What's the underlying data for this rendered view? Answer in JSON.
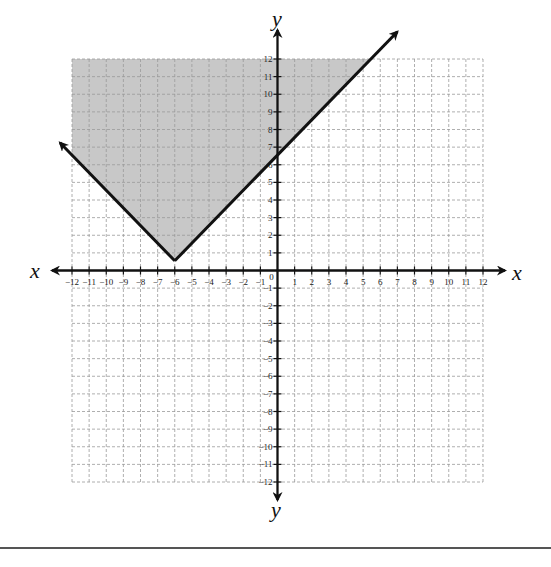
{
  "chart_data": {
    "type": "line",
    "title": "",
    "xlabel": "x",
    "ylabel": "y",
    "xlim": [
      -12,
      12
    ],
    "ylim": [
      -12,
      12
    ],
    "grid": true,
    "grid_style": "dashed",
    "x_ticks": [
      -12,
      -11,
      -10,
      -9,
      -8,
      -7,
      -6,
      -5,
      -4,
      -3,
      -2,
      -1,
      0,
      1,
      2,
      3,
      4,
      5,
      6,
      7,
      8,
      9,
      10,
      11,
      12
    ],
    "y_ticks": [
      -12,
      -11,
      -10,
      -9,
      -8,
      -7,
      -6,
      -5,
      -4,
      -3,
      -2,
      -1,
      1,
      2,
      3,
      4,
      5,
      6,
      7,
      8,
      9,
      10,
      11,
      12
    ],
    "x_tick_labels": [
      "−12",
      "−11",
      "−10",
      "−9",
      "−8",
      "−7",
      "−6",
      "−5",
      "−4",
      "−3",
      "−2",
      "−1",
      "0",
      "1",
      "2",
      "3",
      "4",
      "5",
      "6",
      "7",
      "8",
      "9",
      "10",
      "11",
      "12"
    ],
    "y_tick_labels": [
      "−12",
      "−11",
      "−10",
      "−9",
      "−8",
      "−7",
      "−6",
      "−5",
      "−4",
      "−3",
      "−2",
      "−1",
      "1",
      "2",
      "3",
      "4",
      "5",
      "6",
      "7",
      "8",
      "9",
      "10",
      "11",
      "12"
    ],
    "series": [
      {
        "name": "y = |x + 6|",
        "kind": "absolute-value boundary (solid)",
        "vertex": [
          -6,
          0
        ],
        "points": [
          [
            -12.7,
            6.7
          ],
          [
            -6,
            0
          ],
          [
            7,
            13
          ]
        ],
        "arrows": "both ends",
        "color": "#111111"
      }
    ],
    "shaded_region": {
      "inequality": "y ≥ |x + 6|",
      "description": "region above the V, clipped to grid",
      "color": "#c8c8c8"
    },
    "legend": null
  },
  "labels": {
    "x_left": "x",
    "x_right": "x",
    "y_top": "y",
    "y_bottom": "y"
  },
  "colors": {
    "grid": "#9a9a9a",
    "axis": "#111111",
    "shade": "#c8c8c8",
    "line": "#111111"
  }
}
